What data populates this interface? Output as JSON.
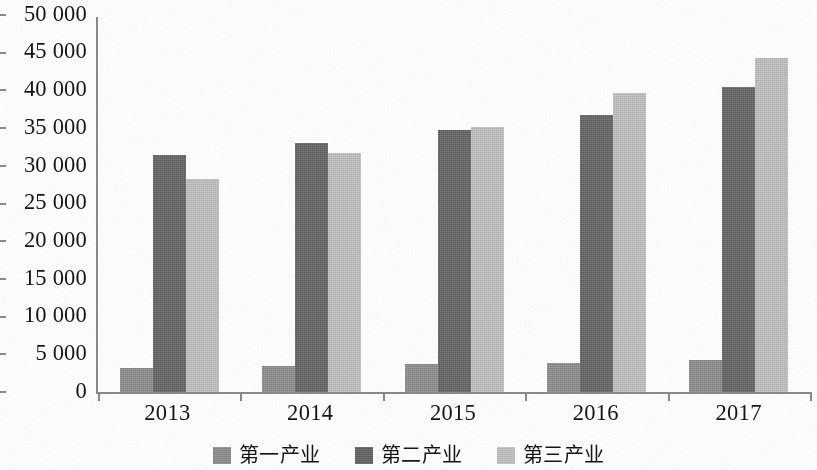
{
  "chart_data": {
    "type": "bar",
    "title": "",
    "subtitle": "",
    "xlabel": "",
    "ylabel": "",
    "categories": [
      "2013",
      "2014",
      "2015",
      "2016",
      "2017"
    ],
    "series": [
      {
        "name": "第一产业",
        "color": "#8c8c8c",
        "values": [
          3200,
          3400,
          3700,
          3900,
          4200
        ]
      },
      {
        "name": "第二产业",
        "color": "#616161",
        "values": [
          31400,
          33000,
          34700,
          36800,
          40400
        ]
      },
      {
        "name": "第三产业",
        "color": "#c2c2c2",
        "values": [
          28200,
          31700,
          35200,
          39600,
          44300
        ]
      }
    ],
    "ylim": [
      0,
      50000
    ],
    "ystep": 5000,
    "ytick_labels": [
      "0",
      "5 000",
      "10 000",
      "15 000",
      "20 000",
      "25 000",
      "30 000",
      "35 000",
      "40 000",
      "45 000",
      "50 000"
    ],
    "ytick_values": [
      0,
      5000,
      10000,
      15000,
      20000,
      25000,
      30000,
      35000,
      40000,
      45000,
      50000
    ],
    "grid": false,
    "legend_position": "bottom",
    "axis_color": "#8a8a8a"
  }
}
